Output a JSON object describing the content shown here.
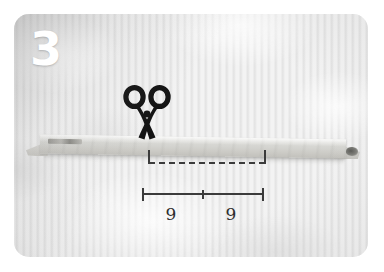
{
  "photo": {
    "step_number": "3",
    "alt_description": "Step 3 of a craft tutorial: a long pale fabric strip laid on white ribbed cloth, with a scissors icon above a dashed cutting line and a measurement bracket marked 9 and 9 below.",
    "background_color": "#f3f3f3",
    "border_color": "#ffffff"
  },
  "icons": {
    "scissors": {
      "name": "scissors-icon",
      "color": "#141414",
      "meaning": "cut here"
    }
  },
  "cut_line": {
    "name": "dashed-cut-line",
    "style": "dashed",
    "color": "#3b3b3b",
    "end_tick_left": "|",
    "end_tick_right": "|"
  },
  "measurement": {
    "name": "measurement-bracket",
    "color": "#3b3b3b",
    "segments": [
      {
        "label": "9",
        "position": "left"
      },
      {
        "label": "9",
        "position": "right"
      }
    ],
    "total_label": "18",
    "unit_note": ""
  },
  "workpiece": {
    "name": "fabric-strip",
    "color": "#d4d4d0",
    "shape": "long tapered strip"
  }
}
